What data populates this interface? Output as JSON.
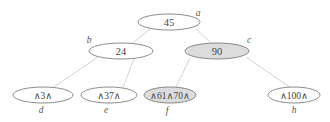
{
  "diagram": {
    "type": "tree",
    "colors": {
      "node_fill": "#ffffff",
      "highlight_fill": "#dcdcdc",
      "edge": "#c8c8c8",
      "border": "#6e6e6e"
    },
    "nodes": [
      {
        "id": "a",
        "label": "a",
        "text": "45",
        "shaded": false
      },
      {
        "id": "b",
        "label": "b",
        "text": "24",
        "shaded": false
      },
      {
        "id": "c",
        "label": "c",
        "text": "90",
        "shaded": true
      },
      {
        "id": "d",
        "label": "d",
        "text": "∧3∧",
        "shaded": false
      },
      {
        "id": "e",
        "label": "e",
        "text": "∧37∧",
        "shaded": false
      },
      {
        "id": "f",
        "label": "f",
        "text": "∧61∧70∧",
        "shaded": true
      },
      {
        "id": "h",
        "label": "h",
        "text": "∧100∧",
        "shaded": false
      }
    ],
    "edges": [
      {
        "from": "a",
        "to": "b"
      },
      {
        "from": "a",
        "to": "c"
      },
      {
        "from": "b",
        "to": "d"
      },
      {
        "from": "b",
        "to": "e"
      },
      {
        "from": "c",
        "to": "f"
      },
      {
        "from": "c",
        "to": "h"
      }
    ]
  }
}
